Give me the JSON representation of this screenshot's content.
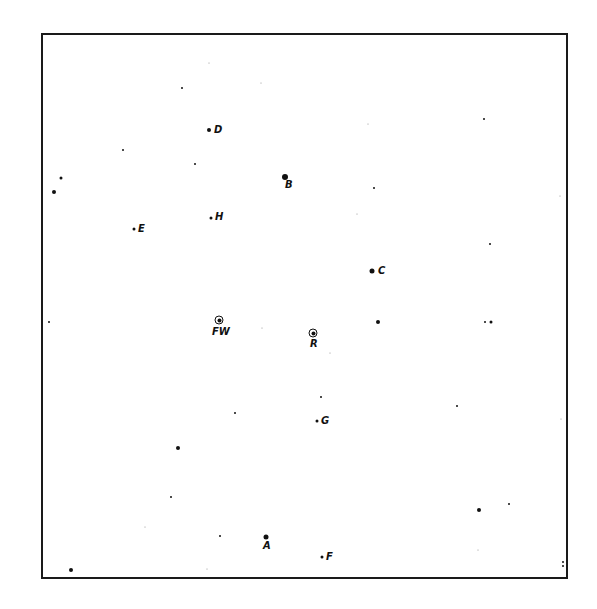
{
  "chart": {
    "frame": {
      "left": 41,
      "top": 33,
      "right": 568,
      "bottom": 579,
      "color": "#1a1a1a"
    },
    "ink_color": "#111111",
    "background": "#ffffff"
  },
  "chart_data": {
    "type": "scatter",
    "title": "",
    "xlabel": "",
    "ylabel": "",
    "grid": false,
    "labeled_stars": [
      {
        "label": "D",
        "x": 209,
        "y": 130,
        "size": 4,
        "marker": "dot",
        "label_dx": 5,
        "label_dy": -5
      },
      {
        "label": "B",
        "x": 285,
        "y": 177,
        "size": 6,
        "marker": "dot",
        "label_dx": 0,
        "label_dy": 3
      },
      {
        "label": "H",
        "x": 211,
        "y": 218,
        "size": 3,
        "marker": "dot",
        "label_dx": 4,
        "label_dy": -6
      },
      {
        "label": "E",
        "x": 134,
        "y": 229,
        "size": 3,
        "marker": "dot",
        "label_dx": 4,
        "label_dy": -5
      },
      {
        "label": "C",
        "x": 372,
        "y": 271,
        "size": 5,
        "marker": "dot",
        "label_dx": 6,
        "label_dy": -5
      },
      {
        "label": "FW",
        "x": 219,
        "y": 320,
        "size": 9,
        "marker": "ring",
        "label_dx": -7,
        "label_dy": 7
      },
      {
        "label": "R",
        "x": 313,
        "y": 333,
        "size": 9,
        "marker": "ring",
        "label_dx": -3,
        "label_dy": 6
      },
      {
        "label": "G",
        "x": 317,
        "y": 421,
        "size": 3,
        "marker": "dot",
        "label_dx": 4,
        "label_dy": -5
      },
      {
        "label": "A",
        "x": 266,
        "y": 537,
        "size": 5,
        "marker": "dot",
        "label_dx": -3,
        "label_dy": 4
      },
      {
        "label": "F",
        "x": 322,
        "y": 557,
        "size": 3,
        "marker": "dot",
        "label_dx": 4,
        "label_dy": -5
      }
    ],
    "unlabeled_stars": [
      {
        "x": 182,
        "y": 88,
        "size": 2
      },
      {
        "x": 261,
        "y": 83,
        "size": 1
      },
      {
        "x": 123,
        "y": 150,
        "size": 2
      },
      {
        "x": 195,
        "y": 164,
        "size": 2
      },
      {
        "x": 61,
        "y": 178,
        "size": 3
      },
      {
        "x": 54,
        "y": 192,
        "size": 4
      },
      {
        "x": 209,
        "y": 63,
        "size": 1
      },
      {
        "x": 484,
        "y": 119,
        "size": 2
      },
      {
        "x": 374,
        "y": 188,
        "size": 2
      },
      {
        "x": 368,
        "y": 124,
        "size": 1
      },
      {
        "x": 490,
        "y": 244,
        "size": 2
      },
      {
        "x": 560,
        "y": 196,
        "size": 1
      },
      {
        "x": 357,
        "y": 214,
        "size": 1
      },
      {
        "x": 49,
        "y": 322,
        "size": 2
      },
      {
        "x": 262,
        "y": 328,
        "size": 1
      },
      {
        "x": 378,
        "y": 322,
        "size": 4
      },
      {
        "x": 485,
        "y": 322,
        "size": 2
      },
      {
        "x": 491,
        "y": 322,
        "size": 3
      },
      {
        "x": 330,
        "y": 353,
        "size": 1
      },
      {
        "x": 235,
        "y": 413,
        "size": 2
      },
      {
        "x": 321,
        "y": 397,
        "size": 2
      },
      {
        "x": 457,
        "y": 406,
        "size": 2
      },
      {
        "x": 561,
        "y": 419,
        "size": 1
      },
      {
        "x": 178,
        "y": 448,
        "size": 4
      },
      {
        "x": 171,
        "y": 497,
        "size": 2
      },
      {
        "x": 145,
        "y": 527,
        "size": 1
      },
      {
        "x": 220,
        "y": 536,
        "size": 2
      },
      {
        "x": 479,
        "y": 510,
        "size": 4
      },
      {
        "x": 509,
        "y": 504,
        "size": 2
      },
      {
        "x": 478,
        "y": 550,
        "size": 1
      },
      {
        "x": 207,
        "y": 569,
        "size": 1
      },
      {
        "x": 71,
        "y": 570,
        "size": 4
      },
      {
        "x": 563,
        "y": 562,
        "size": 2
      },
      {
        "x": 563,
        "y": 566,
        "size": 2
      }
    ]
  }
}
